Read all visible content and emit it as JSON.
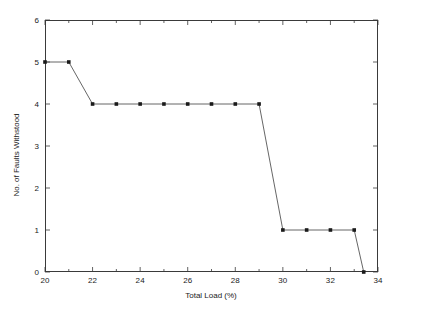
{
  "chart_data": {
    "type": "line",
    "title": "",
    "xlabel": "Total Load (%)",
    "ylabel": "No. of Faults Withstood",
    "xlim": [
      20,
      34
    ],
    "ylim": [
      0,
      6
    ],
    "xticks": [
      20,
      21,
      22,
      23,
      24,
      25,
      26,
      27,
      28,
      29,
      30,
      31,
      32,
      33,
      34
    ],
    "xticklabels": [
      "20",
      "",
      "22",
      "",
      "24",
      "",
      "26",
      "",
      "28",
      "",
      "30",
      "",
      "32",
      "",
      "34"
    ],
    "yticks": [
      0,
      1,
      2,
      3,
      4,
      5,
      6
    ],
    "yticklabels": [
      "0",
      "1",
      "2",
      "3",
      "4",
      "5",
      "6"
    ],
    "grid": false,
    "legend": null,
    "marker": "square",
    "line_color": "#555555",
    "marker_color": "#1a1a1a",
    "frame": "box",
    "series": [
      {
        "name": "Faults Withstood vs Total Load",
        "x": [
          20,
          21,
          22,
          23,
          24,
          25,
          26,
          27,
          28,
          29,
          30,
          31,
          32,
          33,
          33.4
        ],
        "y": [
          5,
          5,
          4,
          4,
          4,
          4,
          4,
          4,
          4,
          4,
          1,
          1,
          1,
          1,
          0
        ]
      }
    ]
  }
}
